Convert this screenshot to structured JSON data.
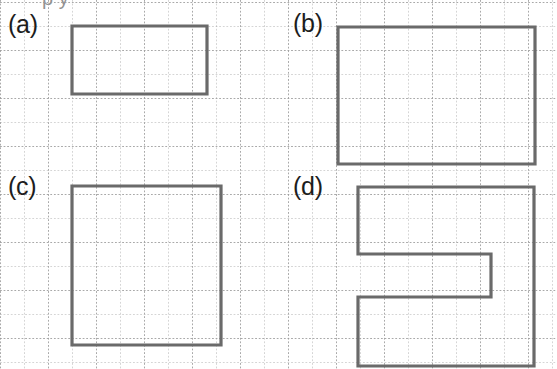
{
  "figure": {
    "width": 557,
    "height": 369,
    "background_color": "#ffffff",
    "clipped_caption_text": "p y",
    "grid": {
      "cell_size_px": 24,
      "origin_x": 0,
      "origin_y": 2,
      "line_color": "#9a9a9a",
      "style": "dotted",
      "vertical_count": 24,
      "horizontal_count": 16
    },
    "shape_style": {
      "stroke_color": "#6a6a6a",
      "stroke_width": 3.2,
      "fill": "none"
    },
    "label_color": "#1d1d1d"
  },
  "panels": [
    {
      "id": "a",
      "label": "(a)",
      "label_x": 8,
      "label_y": 12,
      "shape_type": "rectangle",
      "grid_width_cells": 5.6,
      "grid_height_cells": 2.8,
      "points": "72,26 207,26 207,94 72,94 72,26"
    },
    {
      "id": "b",
      "label": "(b)",
      "label_x": 293,
      "label_y": 11,
      "shape_type": "rectangle",
      "grid_width_cells": 8.2,
      "grid_height_cells": 5.8,
      "points": "338,27 535,27 535,164 338,164 338,27"
    },
    {
      "id": "c",
      "label": "(c)",
      "label_x": 8,
      "label_y": 174,
      "shape_type": "square",
      "grid_width_cells": 6.2,
      "grid_height_cells": 6.7,
      "points": "72,186 221,186 221,345 72,345 72,186"
    },
    {
      "id": "d",
      "label": "(d)",
      "label_x": 293,
      "label_y": 174,
      "shape_type": "notched-rectangle",
      "grid_width_cells": 7.3,
      "grid_height_cells": 7.5,
      "points": "358,187 534,187 534,366 358,366 358,297 491,297 491,254 358,254 358,187"
    }
  ]
}
